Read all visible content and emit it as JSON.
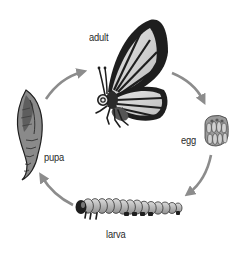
{
  "diagram": {
    "title": "",
    "type": "life-cycle",
    "stages": [
      {
        "id": "adult",
        "label": "adult"
      },
      {
        "id": "egg",
        "label": "egg"
      },
      {
        "id": "larva",
        "label": "larva"
      },
      {
        "id": "pupa",
        "label": "pupa"
      }
    ],
    "flow": [
      "adult",
      "egg",
      "larva",
      "pupa",
      "adult"
    ],
    "colors": {
      "arrow": "#8c8c8c",
      "label": "#2a2a2a",
      "outline": "#1a1a1a",
      "fill_light": "#d9d9d9",
      "fill_mid": "#9a9a9a",
      "background": "#ffffff"
    }
  }
}
